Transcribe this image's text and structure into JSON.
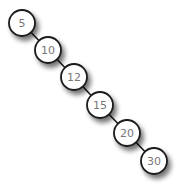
{
  "diagram": {
    "type": "binary-search-tree",
    "nodes": [
      {
        "id": "n5",
        "label": "5",
        "cx": 22,
        "cy": 23
      },
      {
        "id": "n10",
        "label": "10",
        "cx": 48,
        "cy": 50
      },
      {
        "id": "n12",
        "label": "12",
        "cx": 74,
        "cy": 77
      },
      {
        "id": "n15",
        "label": "15",
        "cx": 100,
        "cy": 105
      },
      {
        "id": "n20",
        "label": "20",
        "cx": 127,
        "cy": 133
      },
      {
        "id": "n30",
        "label": "30",
        "cx": 154,
        "cy": 161
      }
    ],
    "edges": [
      {
        "from": "5",
        "to": "10",
        "side": "right"
      },
      {
        "from": "10",
        "to": "12",
        "side": "right"
      },
      {
        "from": "12",
        "to": "15",
        "side": "right"
      },
      {
        "from": "15",
        "to": "20",
        "side": "right"
      },
      {
        "from": "20",
        "to": "30",
        "side": "right"
      }
    ],
    "node_radius": 13,
    "colors": {
      "stroke": "#1a1a1a",
      "fill": "#ffffff",
      "label": "#777777",
      "shadow": "#000000"
    }
  }
}
